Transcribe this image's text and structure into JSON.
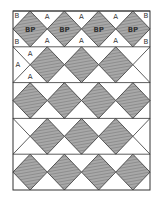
{
  "diagram": {
    "colors": {
      "line": "#333333",
      "fill_shaded": "#9a9a9a",
      "fill_light": "#ffffff",
      "hatch": "#6e6e6e"
    },
    "rows": [
      {
        "type": "full",
        "diamonds": 4,
        "labeled": true,
        "diamond_label": "BP",
        "side_triangle_label": "A",
        "corner_label": "B"
      },
      {
        "type": "offset",
        "diamonds": 3,
        "labeled": true,
        "end_triangle_label": "A"
      },
      {
        "type": "full",
        "diamonds": 4,
        "labeled": false
      },
      {
        "type": "offset",
        "diamonds": 3,
        "labeled": false
      },
      {
        "type": "full",
        "diamonds": 4,
        "labeled": false
      }
    ],
    "labels": {
      "bp": "BP",
      "a": "A",
      "b": "B"
    }
  }
}
